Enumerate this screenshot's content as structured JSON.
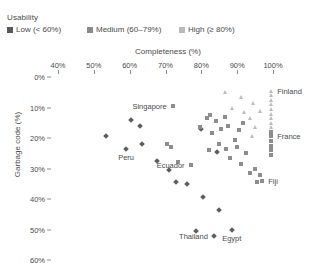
{
  "legend": {
    "title": "Usability",
    "items": [
      {
        "label": "Low (< 60%)",
        "key": "low-marker-icon"
      },
      {
        "label": "Medium (60–79%)",
        "key": "medium-marker-icon"
      },
      {
        "label": "High (≥ 80%)",
        "key": "high-marker-icon"
      }
    ]
  },
  "colors": {
    "low": "#5e5e5e",
    "medium": "#8d8d8d",
    "high": "#bcbcbc",
    "text": "#4a4a4a",
    "axis": "#8d8d8d"
  },
  "axes": {
    "x_title": "Completeness (%)",
    "y_title": "Garbage code (%)",
    "x_ticks": [
      "40%",
      "50%",
      "60%",
      "70%",
      "80%",
      "90%",
      "100%"
    ],
    "y_ticks": [
      "0%",
      "10%",
      "20%",
      "30%",
      "40%",
      "50%",
      "60%"
    ]
  },
  "chart_data": {
    "type": "scatter",
    "title": "",
    "xlabel": "Completeness (%)",
    "ylabel": "Garbage code (%)",
    "xlim": [
      40,
      100
    ],
    "ylim": [
      0,
      60
    ],
    "y_inverted": true,
    "x_axis_position": "top",
    "grid": false,
    "legend_position": "top-left",
    "legend_title": "Usability",
    "series": [
      {
        "name": "Low (< 60%)",
        "marker": "diamond",
        "color": "#5e5e5e",
        "points": [
          {
            "x": 53.5,
            "y": 19.5
          },
          {
            "x": 60.5,
            "y": 14.0
          },
          {
            "x": 63.0,
            "y": 16.0
          },
          {
            "x": 59.0,
            "y": 23.5
          },
          {
            "x": 63.5,
            "y": 22.0
          },
          {
            "x": 67.5,
            "y": 27.5
          },
          {
            "x": 71.0,
            "y": 30.5
          },
          {
            "x": 73.0,
            "y": 34.5
          },
          {
            "x": 76.0,
            "y": 35.0
          },
          {
            "x": 80.5,
            "y": 39.5
          },
          {
            "x": 85.0,
            "y": 43.5
          },
          {
            "x": 78.5,
            "y": 50.5
          },
          {
            "x": 83.5,
            "y": 52.0
          },
          {
            "x": 88.5,
            "y": 50.0
          },
          {
            "x": 84.5,
            "y": 24.5
          },
          {
            "x": 80.0,
            "y": 17.0
          }
        ]
      },
      {
        "name": "Medium (60–79%)",
        "marker": "square",
        "color": "#8d8d8d",
        "points": [
          {
            "x": 72.0,
            "y": 9.5
          },
          {
            "x": 70.5,
            "y": 22.0
          },
          {
            "x": 71.5,
            "y": 23.0
          },
          {
            "x": 73.5,
            "y": 28.0
          },
          {
            "x": 77.0,
            "y": 29.0
          },
          {
            "x": 79.5,
            "y": 16.5
          },
          {
            "x": 81.5,
            "y": 13.5
          },
          {
            "x": 82.5,
            "y": 12.5
          },
          {
            "x": 84.0,
            "y": 14.5
          },
          {
            "x": 83.0,
            "y": 18.5
          },
          {
            "x": 85.5,
            "y": 17.0
          },
          {
            "x": 86.5,
            "y": 13.0
          },
          {
            "x": 87.5,
            "y": 16.0
          },
          {
            "x": 85.0,
            "y": 22.0
          },
          {
            "x": 87.0,
            "y": 23.5
          },
          {
            "x": 82.0,
            "y": 24.0
          },
          {
            "x": 89.5,
            "y": 20.5
          },
          {
            "x": 90.5,
            "y": 17.5
          },
          {
            "x": 91.5,
            "y": 15.0
          },
          {
            "x": 90.0,
            "y": 23.0
          },
          {
            "x": 92.5,
            "y": 25.0
          },
          {
            "x": 88.0,
            "y": 26.5
          },
          {
            "x": 91.0,
            "y": 28.5
          },
          {
            "x": 93.5,
            "y": 31.5
          },
          {
            "x": 95.0,
            "y": 30.0
          },
          {
            "x": 96.5,
            "y": 32.0
          },
          {
            "x": 95.5,
            "y": 34.5
          },
          {
            "x": 97.0,
            "y": 34.0
          },
          {
            "x": 99.5,
            "y": 21.0
          },
          {
            "x": 99.5,
            "y": 22.5
          },
          {
            "x": 99.5,
            "y": 24.0
          },
          {
            "x": 99.5,
            "y": 25.5
          },
          {
            "x": 99.5,
            "y": 18.0
          },
          {
            "x": 99.5,
            "y": 19.5
          }
        ]
      },
      {
        "name": "High (≥ 80%)",
        "marker": "triangle",
        "color": "#bcbcbc",
        "points": [
          {
            "x": 86.5,
            "y": 5.0
          },
          {
            "x": 91.0,
            "y": 6.5
          },
          {
            "x": 88.5,
            "y": 10.0
          },
          {
            "x": 92.0,
            "y": 11.5
          },
          {
            "x": 94.5,
            "y": 8.5
          },
          {
            "x": 93.5,
            "y": 13.5
          },
          {
            "x": 95.0,
            "y": 16.5
          },
          {
            "x": 94.0,
            "y": 19.5
          },
          {
            "x": 96.5,
            "y": 11.0
          },
          {
            "x": 99.5,
            "y": 4.5
          },
          {
            "x": 99.5,
            "y": 6.0
          },
          {
            "x": 99.5,
            "y": 7.5
          },
          {
            "x": 99.5,
            "y": 9.0
          },
          {
            "x": 99.5,
            "y": 10.5
          },
          {
            "x": 99.5,
            "y": 12.0
          },
          {
            "x": 99.5,
            "y": 13.5
          },
          {
            "x": 99.5,
            "y": 15.0
          },
          {
            "x": 99.5,
            "y": 16.5
          }
        ]
      }
    ],
    "annotations": [
      {
        "label": "Singapore",
        "x": 72.0,
        "y": 9.5,
        "placement": "left"
      },
      {
        "label": "Peru",
        "x": 59.0,
        "y": 23.5,
        "placement": "below"
      },
      {
        "label": "Ecuador",
        "x": 77.0,
        "y": 29.0,
        "placement": "left"
      },
      {
        "label": "Finland",
        "x": 99.5,
        "y": 4.5,
        "placement": "right"
      },
      {
        "label": "France",
        "x": 99.5,
        "y": 19.5,
        "placement": "right"
      },
      {
        "label": "Fiji",
        "x": 97.0,
        "y": 34.0,
        "placement": "right"
      },
      {
        "label": "Thailand",
        "x": 83.5,
        "y": 52.0,
        "placement": "left"
      },
      {
        "label": "Egypt",
        "x": 88.5,
        "y": 50.0,
        "placement": "below"
      }
    ]
  }
}
